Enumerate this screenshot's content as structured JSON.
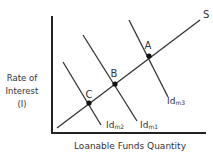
{
  "diagram": {
    "y_axis_label": [
      "Rate of",
      "Interest",
      "(I)"
    ],
    "x_axis_label": "Loanable Funds Quantity",
    "supply_label": "S",
    "demand_curves": [
      {
        "label_main": "Id",
        "label_sub": "m2"
      },
      {
        "label_main": "Id",
        "label_sub": "m1"
      },
      {
        "label_main": "Id",
        "label_sub": "m3"
      }
    ],
    "points": [
      {
        "label": "A"
      },
      {
        "label": "B"
      },
      {
        "label": "C"
      }
    ],
    "colors": {
      "line": "#333333",
      "axis": "#222222"
    }
  }
}
